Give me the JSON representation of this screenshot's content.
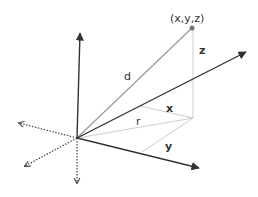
{
  "diagram": {
    "type": "3d-coordinate-system",
    "labels": {
      "point": "(x,y,z)",
      "d": "d",
      "z": "z",
      "x": "x",
      "r": "r",
      "y": "y"
    },
    "colors": {
      "axis": "#333333",
      "distance_line": "#999999",
      "projection_line": "#cccccc",
      "point": "#777777",
      "negative_axis": "#444444"
    }
  }
}
